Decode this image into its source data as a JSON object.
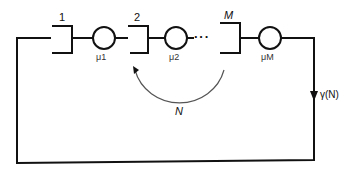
{
  "diagram": {
    "type": "closed queueing network",
    "queues": [
      {
        "index_label": "1",
        "service_rate_label": "μ1"
      },
      {
        "index_label": "2",
        "service_rate_label": "μ2"
      },
      {
        "index_label": "M",
        "service_rate_label": "μM"
      }
    ],
    "ellipsis": "···",
    "population_label": "N",
    "throughput_label": "γ(N)",
    "colors": {
      "line": "#111111",
      "arc": "#555555",
      "background": "#ffffff"
    }
  }
}
